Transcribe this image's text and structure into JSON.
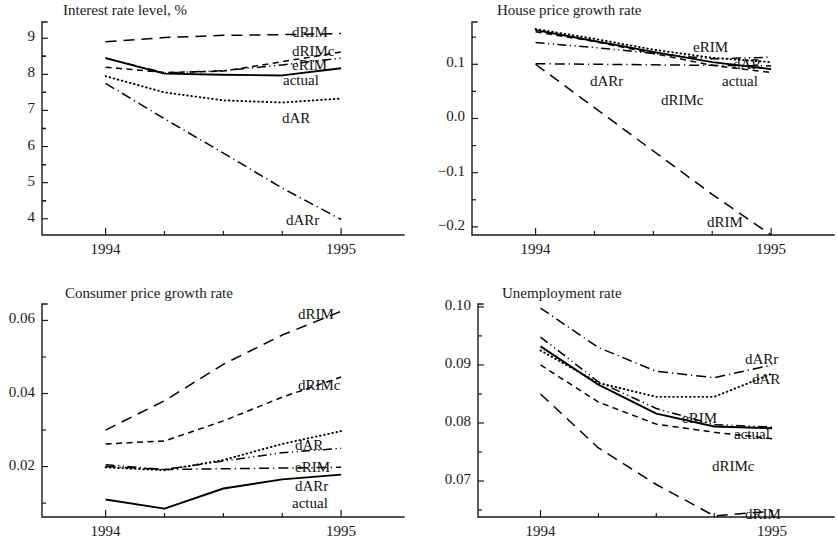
{
  "figure": {
    "width": 837,
    "height": 558,
    "background": "#ffffff",
    "ink": "#1a1a1a"
  },
  "chart_data": [
    {
      "id": "interest-rate-level",
      "type": "line",
      "title": "Interest rate level, %",
      "xlabel": "",
      "ylabel": "",
      "grid": false,
      "legend_position": "inline-right",
      "xlim": [
        1993.73,
        1995.25
      ],
      "ylim": [
        3.55,
        9.45
      ],
      "xticks": [
        1994,
        1995
      ],
      "xticklabels": [
        "1994",
        "1995"
      ],
      "xminorticks": [
        1994.25,
        1994.5,
        1994.75
      ],
      "yticks": [
        4,
        5,
        6,
        7,
        8,
        9
      ],
      "yticklabels": [
        "4",
        "5",
        "6",
        "7",
        "8",
        "9"
      ],
      "x": [
        1994.0,
        1994.25,
        1994.5,
        1994.75,
        1995.0
      ],
      "series": [
        {
          "name": "dRIM",
          "style": "longdash",
          "values": [
            8.9,
            9.02,
            9.08,
            9.1,
            9.13
          ]
        },
        {
          "name": "dRIMc",
          "style": "shortdash",
          "values": [
            8.2,
            8.05,
            8.09,
            8.35,
            8.62
          ]
        },
        {
          "name": "eRIM",
          "style": "dashdotdot",
          "values": [
            8.45,
            8.04,
            8.1,
            8.26,
            8.45
          ]
        },
        {
          "name": "actual",
          "style": "solid",
          "values": [
            8.45,
            8.02,
            7.99,
            7.97,
            8.17
          ]
        },
        {
          "name": "dAR",
          "style": "dotted",
          "values": [
            7.95,
            7.5,
            7.28,
            7.22,
            7.33
          ]
        },
        {
          "name": "dARr",
          "style": "dashdot",
          "values": [
            7.75,
            6.77,
            5.82,
            4.85,
            3.98
          ]
        }
      ],
      "labels": [
        {
          "text": "dRIM",
          "x": 292,
          "y": 24
        },
        {
          "text": "dRIMc",
          "x": 292,
          "y": 43
        },
        {
          "text": "eRIM",
          "x": 292,
          "y": 57
        },
        {
          "text": "actual",
          "x": 283,
          "y": 72
        },
        {
          "text": "dAR",
          "x": 282,
          "y": 110
        },
        {
          "text": "dARr",
          "x": 286,
          "y": 212
        }
      ]
    },
    {
      "id": "house-price-growth-rate",
      "type": "line",
      "title": "House price growth rate",
      "xlabel": "",
      "ylabel": "",
      "grid": false,
      "legend_position": "inline-right",
      "xlim": [
        1993.73,
        1995.25
      ],
      "ylim": [
        -0.215,
        0.178
      ],
      "xticks": [
        1994,
        1995
      ],
      "xticklabels": [
        "1994",
        "1995"
      ],
      "xminorticks": [
        1994.25,
        1994.5,
        1994.75
      ],
      "yticks": [
        0.1,
        0.0,
        -0.1,
        -0.2
      ],
      "yticklabels": [
        "0.1",
        "0.0",
        "−0.1",
        "−0.2"
      ],
      "x": [
        1994.0,
        1994.25,
        1994.5,
        1994.75,
        1995.0
      ],
      "series": [
        {
          "name": "dRIM",
          "style": "longdash",
          "values": [
            0.1,
            0.02,
            -0.06,
            -0.14,
            -0.215
          ]
        },
        {
          "name": "dRIMc",
          "style": "shortdash",
          "values": [
            0.16,
            0.142,
            0.12,
            0.098,
            0.085
          ]
        },
        {
          "name": "eRIM",
          "style": "dashdotdot",
          "values": [
            0.14,
            0.131,
            0.12,
            0.11,
            0.113
          ]
        },
        {
          "name": "actual",
          "style": "solid",
          "values": [
            0.163,
            0.143,
            0.123,
            0.104,
            0.091
          ]
        },
        {
          "name": "dAR",
          "style": "dotted",
          "values": [
            0.165,
            0.147,
            0.127,
            0.112,
            0.104
          ]
        },
        {
          "name": "dARr",
          "style": "dashdot",
          "values": [
            0.101,
            0.1,
            0.099,
            0.098,
            0.097
          ]
        }
      ],
      "labels": [
        {
          "text": "eRIM",
          "x": 693,
          "y": 39
        },
        {
          "text": "dAR",
          "x": 733,
          "y": 56
        },
        {
          "text": "actual",
          "x": 722,
          "y": 73
        },
        {
          "text": "dARr",
          "x": 590,
          "y": 73
        },
        {
          "text": "dRIMc",
          "x": 661,
          "y": 92
        },
        {
          "text": "dRIM",
          "x": 707,
          "y": 214
        }
      ]
    },
    {
      "id": "consumer-price-growth-rate",
      "type": "line",
      "title": "Consumer price growth rate",
      "xlabel": "",
      "ylabel": "",
      "grid": false,
      "legend_position": "inline-right",
      "xlim": [
        1993.73,
        1995.25
      ],
      "ylim": [
        0.0062,
        0.0645
      ],
      "xticks": [
        1994,
        1995
      ],
      "xticklabels": [
        "1994",
        "1995"
      ],
      "xminorticks": [
        1994.25,
        1994.5,
        1994.75
      ],
      "yticks": [
        0.06,
        0.04,
        0.02
      ],
      "yticklabels": [
        "0.06",
        "0.04",
        "0.02"
      ],
      "x": [
        1994.0,
        1994.25,
        1994.5,
        1994.75,
        1995.0
      ],
      "series": [
        {
          "name": "dRIM",
          "style": "longdash",
          "values": [
            0.03,
            0.038,
            0.048,
            0.056,
            0.0625
          ]
        },
        {
          "name": "dRIMc",
          "style": "shortdash",
          "values": [
            0.0262,
            0.027,
            0.0325,
            0.039,
            0.0445
          ]
        },
        {
          "name": "dAR",
          "style": "dotted",
          "values": [
            0.0198,
            0.019,
            0.0218,
            0.0262,
            0.0297
          ]
        },
        {
          "name": "eRIM",
          "style": "dashdotdot",
          "values": [
            0.0205,
            0.0192,
            0.0215,
            0.0238,
            0.025
          ]
        },
        {
          "name": "dARr",
          "style": "dashdot",
          "values": [
            0.02,
            0.0192,
            0.0194,
            0.0196,
            0.0198
          ]
        },
        {
          "name": "actual",
          "style": "solid",
          "values": [
            0.011,
            0.0085,
            0.014,
            0.0165,
            0.0178
          ]
        }
      ],
      "labels": [
        {
          "text": "dRIM",
          "x": 298,
          "y": 306
        },
        {
          "text": "dRIMc",
          "x": 298,
          "y": 377
        },
        {
          "text": "dAR",
          "x": 295,
          "y": 437
        },
        {
          "text": "eRIM",
          "x": 295,
          "y": 459
        },
        {
          "text": "dARr",
          "x": 295,
          "y": 478
        },
        {
          "text": "actual",
          "x": 292,
          "y": 495
        }
      ]
    },
    {
      "id": "unemployment-rate",
      "type": "line",
      "title": "Unemployment rate",
      "xlabel": "",
      "ylabel": "",
      "grid": false,
      "legend_position": "inline-right",
      "xlim": [
        1993.73,
        1995.25
      ],
      "ylim": [
        0.0638,
        0.1005
      ],
      "xticks": [
        1994,
        1995
      ],
      "xticklabels": [
        "1994",
        "1995"
      ],
      "xminorticks": [
        1994.25,
        1994.5,
        1994.75
      ],
      "yticks": [
        0.1,
        0.09,
        0.08,
        0.07
      ],
      "yticklabels": [
        "0.10",
        "0.09",
        "0.08",
        "0.07"
      ],
      "x": [
        1994.0,
        1994.25,
        1994.5,
        1994.75,
        1995.0
      ],
      "series": [
        {
          "name": "dARr",
          "style": "dashdot",
          "values": [
            0.0998,
            0.093,
            0.0889,
            0.0878,
            0.09
          ]
        },
        {
          "name": "dAR",
          "style": "dotted",
          "values": [
            0.0925,
            0.0869,
            0.0845,
            0.0845,
            0.0885
          ]
        },
        {
          "name": "eRIM",
          "style": "dashdotdot",
          "values": [
            0.0948,
            0.0871,
            0.0825,
            0.0797,
            0.0793
          ]
        },
        {
          "name": "actual",
          "style": "solid",
          "values": [
            0.0932,
            0.0866,
            0.0816,
            0.0794,
            0.0791
          ]
        },
        {
          "name": "dRIMc",
          "style": "shortdash",
          "values": [
            0.09,
            0.0836,
            0.0798,
            0.0784,
            0.0773
          ]
        },
        {
          "name": "dRIM",
          "style": "longdash",
          "values": [
            0.085,
            0.0757,
            0.0694,
            0.064,
            0.0648
          ]
        }
      ],
      "labels": [
        {
          "text": "dARr",
          "x": 745,
          "y": 351
        },
        {
          "text": "dAR",
          "x": 752,
          "y": 371
        },
        {
          "text": "eRIM",
          "x": 682,
          "y": 410
        },
        {
          "text": "actual",
          "x": 734,
          "y": 426
        },
        {
          "text": "dRIMc",
          "x": 712,
          "y": 458
        },
        {
          "text": "dRIM",
          "x": 745,
          "y": 506
        }
      ]
    }
  ]
}
